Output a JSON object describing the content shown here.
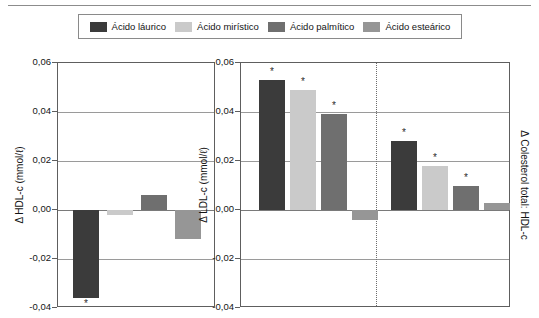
{
  "legend": {
    "items": [
      {
        "label": "Ácido láurico",
        "color": "#3b3b3b"
      },
      {
        "label": "Ácido mirístico",
        "color": "#cacaca"
      },
      {
        "label": "Ácido palmítico",
        "color": "#6f6f6f"
      },
      {
        "label": "Ácido esteárico",
        "color": "#969696"
      }
    ]
  },
  "chart_data": [
    {
      "id": "hdl",
      "type": "bar",
      "title": "",
      "ylabel": "Δ HDL-c (mmol/ℓ)",
      "xlabel": "",
      "ylim": [
        -0.04,
        0.06
      ],
      "yticks": [
        0.06,
        0.04,
        0.02,
        0.0,
        -0.02,
        -0.04
      ],
      "ytick_labels": [
        "0,06",
        "0,04",
        "0,02",
        "0,00",
        "-0,02",
        "-0,04"
      ],
      "grid": true,
      "legend_position": "top",
      "categories": [
        "Ácido láurico",
        "Ácido mirístico",
        "Ácido palmítico",
        "Ácido esteárico"
      ],
      "values": [
        -0.036,
        -0.002,
        0.006,
        -0.012
      ],
      "significance": [
        true,
        false,
        false,
        false
      ],
      "significance_marker": "*"
    },
    {
      "id": "ldl",
      "type": "bar",
      "title": "",
      "ylabel": "Δ LDL-c (mmol/ℓ)",
      "ylabel_right": "Δ Colesterol total: HDL-c",
      "xlabel": "",
      "ylim": [
        -0.04,
        0.06
      ],
      "yticks": [
        0.06,
        0.04,
        0.02,
        0.0,
        -0.02,
        -0.04
      ],
      "ytick_labels": [
        "0,06",
        "0,04",
        "0,02",
        "0,00",
        "-0,02",
        "-0,04"
      ],
      "grid": true,
      "divider": true,
      "groups": [
        {
          "name": "Δ LDL-c (mmol/ℓ)",
          "categories": [
            "Ácido láurico",
            "Ácido mirístico",
            "Ácido palmítico",
            "Ácido esteárico"
          ],
          "values": [
            0.053,
            0.049,
            0.039,
            -0.004
          ],
          "significance": [
            true,
            true,
            true,
            false
          ]
        },
        {
          "name": "Δ Colesterol total: HDL-c",
          "categories": [
            "Ácido láurico",
            "Ácido mirístico",
            "Ácido palmítico",
            "Ácido esteárico"
          ],
          "values": [
            0.028,
            0.018,
            0.01,
            0.003
          ],
          "significance": [
            true,
            true,
            true,
            false
          ]
        }
      ],
      "significance_marker": "*"
    }
  ]
}
